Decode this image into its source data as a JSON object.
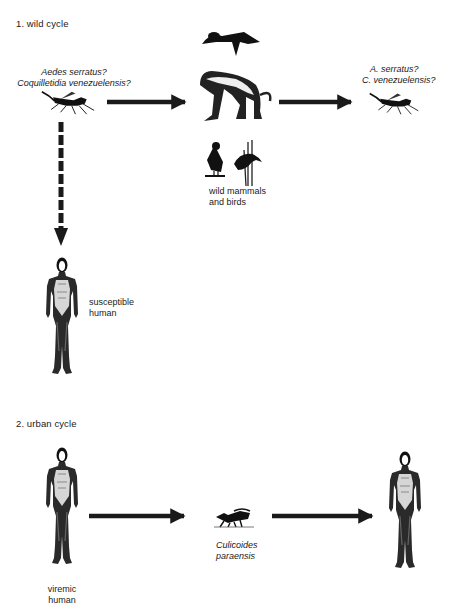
{
  "diagram": {
    "type": "transmission-cycle",
    "sections": [
      {
        "title": "1. wild cycle",
        "nodes": {
          "vector_source": {
            "line1": "Aedes serratus?",
            "line2": "Coquilletidia venezuelensis?",
            "icon": "mosquito-icon"
          },
          "hosts": {
            "line1": "wild mammals",
            "line2": "and birds",
            "icons": [
              "sloth-icon",
              "monkey-icon",
              "bird-icon",
              "heron-in-reeds-icon"
            ]
          },
          "vector_target": {
            "line1": "A.  serratus?",
            "line2": "C.  venezuelensis?",
            "icon": "mosquito-icon"
          },
          "human": {
            "line1": "susceptible",
            "line2": "human",
            "icon": "human-figure-icon"
          }
        },
        "edges": [
          {
            "from": "vector_source",
            "to": "hosts",
            "style": "solid"
          },
          {
            "from": "hosts",
            "to": "vector_target",
            "style": "solid"
          },
          {
            "from": "vector_source",
            "to": "human",
            "style": "dashed"
          }
        ]
      },
      {
        "title": "2. urban cycle",
        "nodes": {
          "source_human": {
            "line1": "viremic",
            "line2": "human",
            "icon": "human-figure-icon"
          },
          "vector": {
            "line1": "Culicoides",
            "line2": "paraensis",
            "icon": "midge-icon"
          },
          "target_human": {
            "icon": "human-figure-icon"
          }
        },
        "edges": [
          {
            "from": "source_human",
            "to": "vector",
            "style": "solid"
          },
          {
            "from": "vector",
            "to": "target_human",
            "style": "solid"
          }
        ]
      }
    ],
    "colors": {
      "ink": "#1a1a1a",
      "background": "#ffffff"
    }
  }
}
